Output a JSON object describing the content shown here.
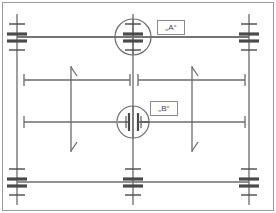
{
  "diagram": {
    "kind": "engineering-dimension-drawing",
    "width": 276,
    "height": 213,
    "background": "#ffffff",
    "line_color": "#6b6b6b",
    "heavy_color": "#4a4a4a",
    "frame_color": "#9a9a9a",
    "label_text_color": "#4a4a4a",
    "label_border_color": "#8a8a8a"
  },
  "labels": {
    "detail_a": "„A“",
    "detail_b": "„B“"
  },
  "detail_callouts": [
    {
      "id": "A",
      "label": "„A“",
      "cx": 133,
      "cy": 37,
      "r": 18,
      "symbol": "i-beam-gap"
    },
    {
      "id": "B",
      "label": "„B“",
      "cx": 133,
      "cy": 122,
      "r": 16,
      "symbol": "double-bar-gap"
    }
  ],
  "support_symbols": [
    {
      "name": "support-top-left",
      "x": 17,
      "y": 37
    },
    {
      "name": "support-top-right",
      "x": 249,
      "y": 37
    },
    {
      "name": "support-bottom-left",
      "x": 17,
      "y": 182
    },
    {
      "name": "support-bottom-center",
      "x": 133,
      "y": 182
    },
    {
      "name": "support-bottom-right",
      "x": 249,
      "y": 182
    }
  ],
  "horizontal_dimensions": [
    {
      "name": "dim-upper-left",
      "y": 80,
      "x1": 24,
      "x2": 130
    },
    {
      "name": "dim-upper-right",
      "y": 80,
      "x1": 138,
      "x2": 245
    },
    {
      "name": "dim-lower-left",
      "y": 122,
      "x1": 24,
      "x2": 115
    },
    {
      "name": "dim-lower-right",
      "y": 122,
      "x1": 151,
      "x2": 245
    }
  ],
  "vertical_dimensions": [
    {
      "name": "dim-vertical-left",
      "x": 71,
      "y1": 66,
      "y2": 152,
      "arrow_top": true,
      "arrow_bottom": true
    },
    {
      "name": "dim-vertical-right",
      "x": 192,
      "y1": 66,
      "y2": 152,
      "arrow_top": true,
      "arrow_bottom": true
    }
  ],
  "extension_lines": [
    {
      "name": "ext-left-vertical",
      "x": 17,
      "y1": 14,
      "y2": 205
    },
    {
      "name": "ext-right-vertical",
      "x": 249,
      "y1": 14,
      "y2": 205
    },
    {
      "name": "ext-center-vertical",
      "x": 133,
      "y1": 14,
      "y2": 205
    },
    {
      "name": "axis-top-horizontal",
      "y": 37,
      "x1": 17,
      "x2": 249
    },
    {
      "name": "axis-bottom-horizontal",
      "y": 182,
      "x1": 17,
      "x2": 249
    }
  ]
}
